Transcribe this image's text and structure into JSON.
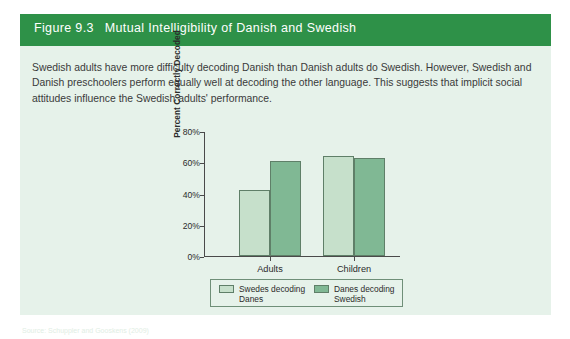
{
  "figure": {
    "number": "Figure 9.3",
    "title": "Mutual Intelligibility of Danish and Swedish",
    "caption": "Swedish adults have more difficulty decoding Danish than Danish adults do Swedish. However, Swedish and Danish preschoolers perform equally well at decoding the other language. This suggests that implicit social attitudes influence the Swedish adults' performance.",
    "source_note": "Source: Schuppler and Gooskens (2009)"
  },
  "colors": {
    "header_green": "#2e9148",
    "panel_background": "#e6f2ea",
    "bar_light": "#c6e0cb",
    "bar_dark": "#80b894",
    "bar_outline": "#5f7f68",
    "axis": "#4a4a4a",
    "text": "#2b2b2b",
    "header_text": "#ffffff"
  },
  "chart_data": {
    "type": "bar",
    "title": "",
    "xlabel": "",
    "ylabel": "Percent Correctly Decoded",
    "ylim": [
      0,
      80
    ],
    "yticks": [
      0,
      20,
      40,
      60,
      80
    ],
    "ytick_labels": [
      "0%",
      "20%",
      "40%",
      "60%",
      "80%"
    ],
    "grid": false,
    "legend_position": "bottom",
    "categories": [
      "Adults",
      "Children"
    ],
    "series": [
      {
        "name": "Swedes decoding\nDanes",
        "legend_label_line1": "Swedes decoding",
        "legend_label_line2": "Danes",
        "color": "#c6e0cb",
        "values": [
          42.5,
          64
        ]
      },
      {
        "name": "Danes decoding\nSwedish",
        "legend_label_line1": "Danes decoding",
        "legend_label_line2": "Swedish",
        "color": "#80b894",
        "values": [
          61,
          62.5
        ]
      }
    ]
  }
}
